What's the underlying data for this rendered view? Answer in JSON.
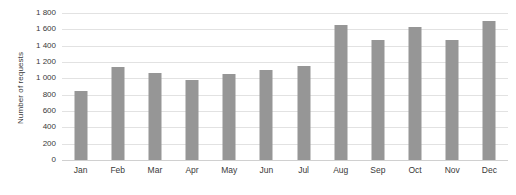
{
  "chart_data": {
    "type": "bar",
    "title": "",
    "subtitle": "",
    "xlabel": "",
    "ylabel": "Number of requests",
    "categories": [
      "Jan",
      "Feb",
      "Mar",
      "Apr",
      "May",
      "Jun",
      "Jul",
      "Aug",
      "Sep",
      "Oct",
      "Nov",
      "Dec"
    ],
    "values": [
      850,
      1140,
      1060,
      980,
      1050,
      1100,
      1150,
      1650,
      1470,
      1630,
      1470,
      1700
    ],
    "ylim": [
      0,
      1800
    ],
    "ytick_values": [
      0,
      200,
      400,
      600,
      800,
      1000,
      1200,
      1400,
      1600,
      1800
    ],
    "ytick_labels": [
      "0",
      "200",
      "400",
      "600",
      "800",
      "1 000",
      "1 200",
      "1 400",
      "1 600",
      "1 800"
    ],
    "grid": "horizontal",
    "legend": "none",
    "bar_color": "#969696",
    "gridline_color": "#e2e2e2",
    "background_color": "#ffffff",
    "text_color": "#3a3a3a"
  }
}
